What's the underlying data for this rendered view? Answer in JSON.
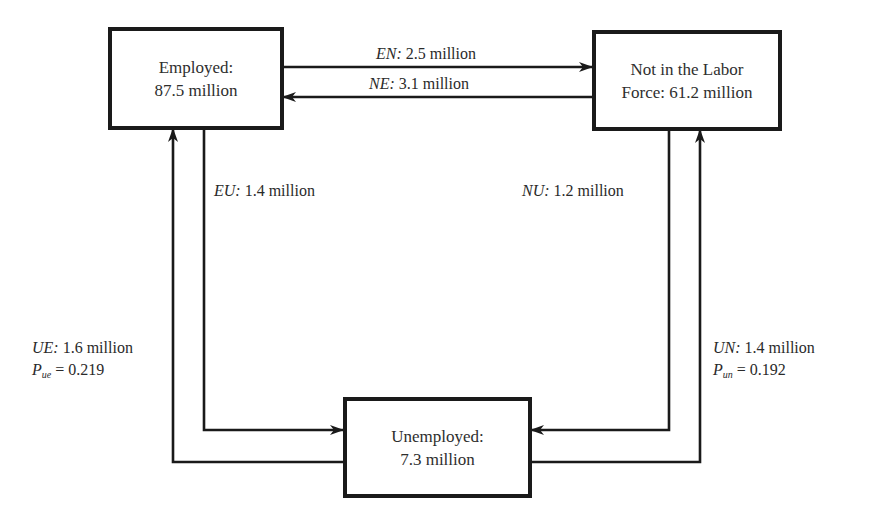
{
  "diagram": {
    "states": {
      "employed": {
        "line1": "Employed:",
        "line2": "87.5 million"
      },
      "not_in_labor_force": {
        "line1": "Not in the Labor",
        "line2": "Force: 61.2 million"
      },
      "unemployed": {
        "line1": "Unemployed:",
        "line2": "7.3 million"
      }
    },
    "flows": {
      "en": {
        "code": "EN:",
        "value": "2.5 million",
        "from": "Employed",
        "to": "Not in the Labor Force"
      },
      "ne": {
        "code": "NE:",
        "value": "3.1 million",
        "from": "Not in the Labor Force",
        "to": "Employed"
      },
      "eu": {
        "code": "EU:",
        "value": "1.4 million",
        "from": "Employed",
        "to": "Unemployed"
      },
      "nu": {
        "code": "NU:",
        "value": "1.2 million",
        "from": "Not in the Labor Force",
        "to": "Unemployed"
      },
      "ue": {
        "code": "UE:",
        "value": "1.6 million",
        "from": "Unemployed",
        "to": "Employed",
        "prob_symbol": "P",
        "prob_sub": "ue",
        "prob_eq": "= 0.219"
      },
      "un": {
        "code": "UN:",
        "value": "1.4 million",
        "from": "Unemployed",
        "to": "Not in the Labor Force",
        "prob_symbol": "P",
        "prob_sub": "un",
        "prob_eq": "= 0.192"
      }
    },
    "colors": {
      "line": "#1a1a1a",
      "text": "#2a2a2a",
      "background": "#ffffff"
    }
  }
}
